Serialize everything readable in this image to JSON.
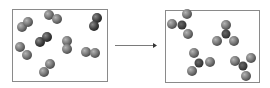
{
  "diagram": {
    "colors": {
      "box_border": "#8a8a8a",
      "atom_light": "#8c8c8c",
      "atom_dark": "#4a4a4a",
      "center_atom": "#3a3a3a",
      "arrow": "#666666"
    },
    "left_box": {
      "label": "reactants",
      "x": 12,
      "y": 9,
      "width": 95,
      "height": 72,
      "molecules": [
        {
          "atoms": [
            [
              22,
              27
            ],
            [
              28,
              22
            ]
          ],
          "dark": false
        },
        {
          "atoms": [
            [
              49,
              15
            ],
            [
              57,
              19
            ]
          ],
          "dark": false
        },
        {
          "atoms": [
            [
              97,
              18
            ],
            [
              94,
              26
            ]
          ],
          "dark": true
        },
        {
          "atoms": [
            [
              40,
              42
            ],
            [
              47,
              37
            ]
          ],
          "dark": true
        },
        {
          "atoms": [
            [
              67,
              41
            ],
            [
              67,
              49
            ]
          ],
          "dark": false
        },
        {
          "atoms": [
            [
              20,
              47
            ],
            [
              27,
              55
            ]
          ],
          "dark": false
        },
        {
          "atoms": [
            [
              86,
              52
            ],
            [
              95,
              53
            ]
          ],
          "dark": false
        },
        {
          "atoms": [
            [
              44,
              72
            ],
            [
              50,
              64
            ]
          ],
          "dark": false
        }
      ]
    },
    "arrow": {
      "x1": 115,
      "y1": 45,
      "x2": 157,
      "y2": 45
    },
    "right_box": {
      "label": "products",
      "x": 165,
      "y": 10,
      "width": 94,
      "height": 72,
      "molecules": [
        {
          "center": [
            182,
            25
          ],
          "atoms": [
            [
              172,
              24
            ],
            [
              187,
              14
            ],
            [
              188,
              34
            ]
          ]
        },
        {
          "center": [
            226,
            34
          ],
          "atoms": [
            [
              226,
              25
            ],
            [
              217,
              41
            ],
            [
              234,
              41
            ]
          ]
        },
        {
          "center": [
            199,
            63
          ],
          "atoms": [
            [
              194,
              53
            ],
            [
              210,
              62
            ],
            [
              192,
              71
            ]
          ]
        },
        {
          "center": [
            243,
            66
          ],
          "atoms": [
            [
              235,
              61
            ],
            [
              251,
              58
            ],
            [
              246,
              76
            ]
          ]
        }
      ]
    }
  }
}
